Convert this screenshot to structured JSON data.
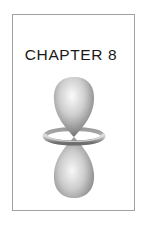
{
  "page": {
    "chapter_label": "CHAPTER",
    "chapter_number": "8",
    "chapter_title": "CHAPTER 8"
  },
  "illustration": {
    "icon": "dz2-orbital-icon",
    "description": "d-orbital with two lobes and a torus ring",
    "colors": {
      "lobe_highlight": "#f4f4f4",
      "lobe_mid": "#bdbdbd",
      "lobe_shadow": "#6e6e6e",
      "frame_border": "#a0a0a0",
      "text": "#1a1a1a"
    }
  }
}
